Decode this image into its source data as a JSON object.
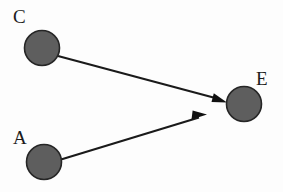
{
  "diagram": {
    "type": "directed-graph",
    "title": "",
    "background_color": "#fdfdfd",
    "node_fill_color": "#5e5e5e",
    "node_stroke_color": "#262626",
    "edge_color": "#1a1a1a",
    "label_color": "#1c1c1c",
    "node_radius": 18,
    "edge_width": 2,
    "nodes": [
      {
        "id": "C",
        "label": "C",
        "cx": 42,
        "cy": 48,
        "r": 18,
        "label_x": 13,
        "label_y": 7
      },
      {
        "id": "E",
        "label": "E",
        "cx": 244,
        "cy": 104,
        "r": 18,
        "label_x": 256,
        "label_y": 69
      },
      {
        "id": "A",
        "label": "A",
        "cx": 44,
        "cy": 162,
        "r": 18,
        "label_x": 13,
        "label_y": 128
      }
    ],
    "edges": [
      {
        "id": "C-E",
        "from": "C",
        "to": "E",
        "directed": true,
        "start_x": 58,
        "start_y": 56,
        "end_x": 226,
        "end_y": 102,
        "arrowhead": "solid-triangle"
      },
      {
        "id": "A-E",
        "from": "A",
        "to": "E",
        "directed": true,
        "start_x": 61,
        "start_y": 159,
        "end_x": 206,
        "end_y": 115,
        "arrowhead": "solid-triangle"
      }
    ]
  }
}
